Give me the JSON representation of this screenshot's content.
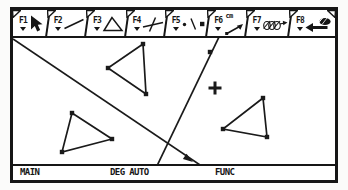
{
  "toolbar": {
    "tabs": [
      {
        "label": "F1",
        "icon": "pointer"
      },
      {
        "label": "F2",
        "icon": "segment"
      },
      {
        "label": "F3",
        "icon": "triangle"
      },
      {
        "label": "F4",
        "icon": "perpendicular"
      },
      {
        "label": "F5",
        "icon": "point-tools"
      },
      {
        "label": "F6",
        "icon": "measure",
        "unit": "cm"
      },
      {
        "label": "F7",
        "icon": "animation"
      },
      {
        "label": "F8",
        "icon": "file-tools"
      }
    ]
  },
  "statusbar": {
    "folder": "MAIN",
    "angle_mode": "DEG AUTO",
    "graph_mode": "FUNC"
  },
  "canvas": {
    "viewbox": "13 38 322 126",
    "stroke": "#1a1a1a",
    "lines": [
      {
        "x1": 13,
        "y1": 39,
        "x2": 209,
        "y2": 171
      },
      {
        "x1": 219,
        "y1": 37,
        "x2": 155,
        "y2": 170
      }
    ],
    "triangles": [
      {
        "points": [
          [
            143,
            44
          ],
          [
            108,
            68
          ],
          [
            146,
            94
          ]
        ]
      },
      {
        "points": [
          [
            72,
            113
          ],
          [
            112,
            139
          ],
          [
            62,
            152
          ]
        ]
      },
      {
        "points": [
          [
            263,
            98
          ],
          [
            223,
            129
          ],
          [
            267,
            137
          ]
        ]
      }
    ],
    "points": [
      [
        210,
        52
      ],
      [
        143,
        44
      ],
      [
        108,
        68
      ],
      [
        146,
        94
      ],
      [
        72,
        113
      ],
      [
        112,
        139
      ],
      [
        62,
        152
      ],
      [
        263,
        98
      ],
      [
        223,
        129
      ],
      [
        267,
        137
      ]
    ],
    "arrowhead": [
      [
        193,
        162
      ],
      [
        182.9,
        159.1
      ],
      [
        186.5,
        153.8
      ]
    ],
    "cursor": {
      "x": 215,
      "y": 88,
      "arm": 6.5
    }
  }
}
